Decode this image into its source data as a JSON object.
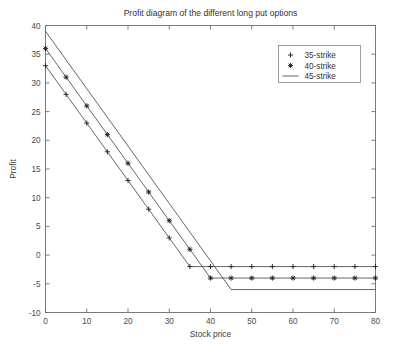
{
  "chart_data": {
    "type": "line",
    "title": "Profit diagram of the different long put options",
    "xlabel": "Stock price",
    "ylabel": "Profit",
    "xlim": [
      0,
      80
    ],
    "ylim": [
      -10,
      40
    ],
    "xticks": [
      0,
      10,
      20,
      30,
      40,
      50,
      60,
      70,
      80
    ],
    "yticks": [
      -10,
      -5,
      0,
      5,
      10,
      15,
      20,
      25,
      30,
      35,
      40
    ],
    "grid": false,
    "legend_position": "upper right",
    "x": [
      0,
      5,
      10,
      15,
      20,
      25,
      30,
      35,
      40,
      45,
      50,
      55,
      60,
      65,
      70,
      75,
      80
    ],
    "series": [
      {
        "name": "35-strike",
        "marker": "plus",
        "strike": 35,
        "premium": 2,
        "values": [
          33,
          28,
          23,
          18,
          13,
          8,
          3,
          -2,
          -2,
          -2,
          -2,
          -2,
          -2,
          -2,
          -2,
          -2,
          -2
        ]
      },
      {
        "name": "40-strike",
        "marker": "star",
        "strike": 40,
        "premium": 4,
        "values": [
          36,
          31,
          26,
          21,
          16,
          11,
          6,
          1,
          -4,
          -4,
          -4,
          -4,
          -4,
          -4,
          -4,
          -4,
          -4
        ]
      },
      {
        "name": "45-strike",
        "marker": "none",
        "strike": 45,
        "premium": 6,
        "values": [
          39,
          34,
          29,
          24,
          19,
          14,
          9,
          4,
          -1,
          -6,
          -6,
          -6,
          -6,
          -6,
          -6,
          -6,
          -6
        ]
      }
    ]
  },
  "legend": {
    "entries": [
      {
        "label": "35-strike"
      },
      {
        "label": "40-strike"
      },
      {
        "label": "45-strike"
      }
    ]
  },
  "colors": {
    "line": "#4a4a4a",
    "axis": "#6e6e6e",
    "text": "#333333",
    "background": "#ffffff"
  }
}
